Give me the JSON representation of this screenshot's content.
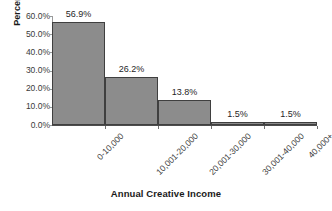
{
  "chart_data": {
    "type": "bar",
    "title": "",
    "subtitle": "",
    "xlabel": "Annual Creative Income",
    "ylabel": "Percent",
    "categories": [
      "0-10,000",
      "10,001-20,000",
      "20,001-30,000",
      "30,001-40,000",
      "40,000+"
    ],
    "values": [
      56.9,
      26.2,
      13.8,
      1.5,
      1.5
    ],
    "data_labels": [
      "56.9%",
      "26.2%",
      "13.8%",
      "1.5%",
      "1.5%"
    ],
    "ylim": [
      0,
      60
    ],
    "y_tick_values": [
      0,
      10,
      20,
      30,
      40,
      50,
      60
    ],
    "y_tick_labels": [
      "0.0%",
      "10.0%",
      "20.0%",
      "30.0%",
      "40.0%",
      "50.0%",
      "60.0%"
    ],
    "grid": false,
    "legend": "none",
    "bar_fill_color": "#8c8c8c",
    "bar_border_color": "#3f3f3f",
    "axis_color": "#4d4d4d",
    "text_color": "#262626",
    "background_color": "#ffffff"
  }
}
